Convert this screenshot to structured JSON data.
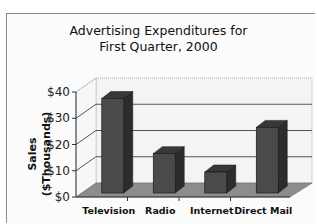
{
  "chart_data": {
    "type": "bar",
    "title": "Advertising Expenditures for First Quarter, 2000",
    "title_lines": [
      "Advertising Expenditures for",
      "First Quarter, 2000"
    ],
    "xlabel": "",
    "ylabel": "Sales ($Thousands)",
    "ylabel_lines": [
      "Sales",
      "($Thousands)"
    ],
    "categories": [
      "Television",
      "Radio",
      "Internet",
      "Direct Mail"
    ],
    "values": [
      36,
      15,
      8,
      25
    ],
    "ylim": [
      0,
      40
    ],
    "yticks": [
      "$0",
      "$10",
      "$20",
      "$30",
      "$40"
    ],
    "grid": true,
    "style": "3d-column",
    "bar_color": "#4a4a4a",
    "legend": null
  }
}
